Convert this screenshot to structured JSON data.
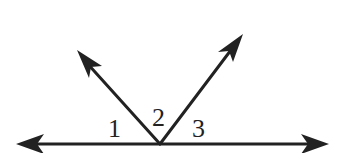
{
  "diagram": {
    "type": "geometry-angles",
    "stroke_color": "#222222",
    "background": "#ffffff",
    "vertex": {
      "x": 160,
      "y": 144
    },
    "line": {
      "left_tip": {
        "x": 16,
        "y": 144
      },
      "right_tip": {
        "x": 329,
        "y": 144
      }
    },
    "rays": [
      {
        "name": "left-ray",
        "tip": {
          "x": 77,
          "y": 50
        }
      },
      {
        "name": "right-ray",
        "tip": {
          "x": 243,
          "y": 34
        }
      }
    ],
    "angle_labels": [
      {
        "id": "1",
        "text": "1"
      },
      {
        "id": "2",
        "text": "2"
      },
      {
        "id": "3",
        "text": "3"
      }
    ]
  }
}
